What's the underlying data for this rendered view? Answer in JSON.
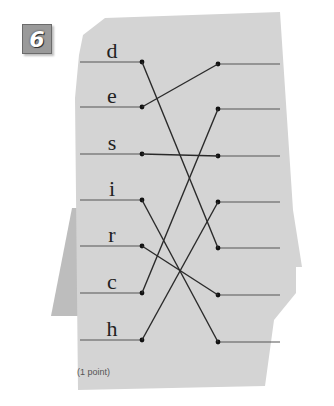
{
  "exercise": {
    "number": "6",
    "points_label": "(1 point)"
  },
  "left_items": [
    {
      "letter": "d",
      "y": 62
    },
    {
      "letter": "e",
      "y": 107
    },
    {
      "letter": "s",
      "y": 154
    },
    {
      "letter": "i",
      "y": 200
    },
    {
      "letter": "r",
      "y": 246
    },
    {
      "letter": "c",
      "y": 293
    },
    {
      "letter": "h",
      "y": 340
    }
  ],
  "right_slots": [
    64,
    109,
    156,
    202,
    248,
    295,
    342
  ],
  "connections": [
    {
      "from": "d",
      "to_slot": 5
    },
    {
      "from": "e",
      "to_slot": 1
    },
    {
      "from": "s",
      "to_slot": 3
    },
    {
      "from": "i",
      "to_slot": 7
    },
    {
      "from": "r",
      "to_slot": 6
    },
    {
      "from": "c",
      "to_slot": 2
    },
    {
      "from": "h",
      "to_slot": 4
    }
  ],
  "colors": {
    "paper": "#d4d4d4",
    "paper_shadow": "#bcbcbc",
    "line": "#2a2a2a",
    "badge": "#9a9a9a"
  }
}
